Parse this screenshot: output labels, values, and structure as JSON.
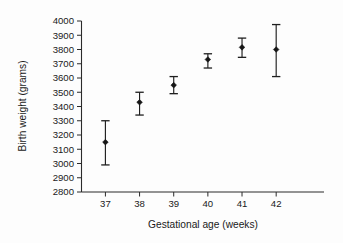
{
  "chart_data": {
    "type": "scatter",
    "title": "",
    "xlabel": "Gestational age (weeks)",
    "ylabel": "Birth weight (grams)",
    "x": [
      37,
      38,
      39,
      40,
      41,
      42
    ],
    "xtick_labels": [
      "37",
      "38",
      "39",
      "40",
      "41",
      "42"
    ],
    "values": [
      3150,
      3430,
      3550,
      3730,
      3815,
      3800
    ],
    "error_low": [
      2990,
      3340,
      3490,
      3670,
      3745,
      3610
    ],
    "error_high": [
      3300,
      3500,
      3610,
      3770,
      3880,
      3975
    ],
    "ylim": [
      2800,
      4000
    ],
    "ytick_labels": [
      "2800",
      "2900",
      "3000",
      "3100",
      "3200",
      "3300",
      "3400",
      "3500",
      "3600",
      "3700",
      "3800",
      "3900",
      "4000"
    ],
    "ytick_values": [
      2800,
      2900,
      3000,
      3100,
      3200,
      3300,
      3400,
      3500,
      3600,
      3700,
      3800,
      3900,
      4000
    ],
    "xlim": [
      36.3,
      43.4
    ],
    "grid": false,
    "legend": null,
    "marker": "filled-diamond",
    "series_name": "Mean birth weight with error bars",
    "colors": {
      "marker": "#161616",
      "errorbar": "#1f1f1f",
      "axis": "#2b2b2b",
      "background": "#fdfdfd"
    }
  }
}
